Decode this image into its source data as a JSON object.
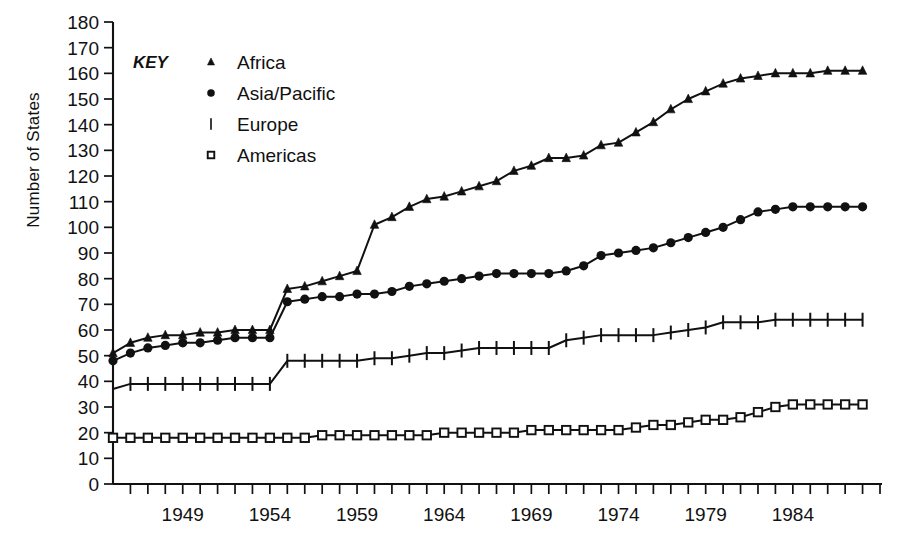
{
  "chart_data": {
    "type": "line",
    "title": "",
    "xlabel": "",
    "ylabel": "Number of States",
    "xlim": [
      1945,
      1989
    ],
    "ylim": [
      0,
      180
    ],
    "ytick_step": 10,
    "xtick_step": 1,
    "grid": false,
    "legend_title": "KEY",
    "legend_position": "top-left-inside",
    "x": [
      1945,
      1946,
      1947,
      1948,
      1949,
      1950,
      1951,
      1952,
      1953,
      1954,
      1955,
      1956,
      1957,
      1958,
      1959,
      1960,
      1961,
      1962,
      1963,
      1964,
      1965,
      1966,
      1967,
      1968,
      1969,
      1970,
      1971,
      1972,
      1973,
      1974,
      1975,
      1976,
      1977,
      1978,
      1979,
      1980,
      1981,
      1982,
      1983,
      1984,
      1985,
      1986,
      1987,
      1988
    ],
    "yticks": [
      0,
      10,
      20,
      30,
      40,
      50,
      60,
      70,
      80,
      90,
      100,
      110,
      120,
      130,
      140,
      150,
      160,
      170,
      180
    ],
    "xticks_labeled": [
      1949,
      1954,
      1959,
      1964,
      1969,
      1974,
      1979,
      1984
    ],
    "series": [
      {
        "name": "Africa",
        "marker": "triangle",
        "values": [
          51,
          55,
          57,
          58,
          58,
          59,
          59,
          60,
          60,
          60,
          76,
          77,
          79,
          81,
          83,
          101,
          104,
          108,
          111,
          112,
          114,
          116,
          118,
          122,
          124,
          127,
          127,
          128,
          132,
          133,
          137,
          141,
          146,
          150,
          153,
          156,
          158,
          159,
          160,
          160,
          160,
          161,
          161,
          161
        ]
      },
      {
        "name": "Asia/Pacific",
        "marker": "circle",
        "values": [
          48,
          51,
          53,
          54,
          55,
          55,
          56,
          57,
          57,
          57,
          71,
          72,
          73,
          73,
          74,
          74,
          75,
          77,
          78,
          79,
          80,
          81,
          82,
          82,
          82,
          82,
          83,
          85,
          89,
          90,
          91,
          92,
          94,
          96,
          98,
          100,
          103,
          106,
          107,
          108,
          108,
          108,
          108,
          108
        ]
      },
      {
        "name": "Europe",
        "marker": "bar",
        "values": [
          37,
          39,
          39,
          39,
          39,
          39,
          39,
          39,
          39,
          39,
          48,
          48,
          48,
          48,
          48,
          49,
          49,
          50,
          51,
          51,
          52,
          53,
          53,
          53,
          53,
          53,
          56,
          57,
          58,
          58,
          58,
          58,
          59,
          60,
          61,
          63,
          63,
          63,
          64,
          64,
          64,
          64,
          64,
          64
        ]
      },
      {
        "name": "Americas",
        "marker": "square",
        "values": [
          18,
          18,
          18,
          18,
          18,
          18,
          18,
          18,
          18,
          18,
          18,
          18,
          19,
          19,
          19,
          19,
          19,
          19,
          19,
          20,
          20,
          20,
          20,
          20,
          21,
          21,
          21,
          21,
          21,
          21,
          22,
          23,
          23,
          24,
          25,
          25,
          26,
          28,
          30,
          31,
          31,
          31,
          31,
          31
        ]
      }
    ]
  },
  "legend": {
    "key_label": "KEY",
    "entries": [
      {
        "label": "Africa",
        "marker": "triangle"
      },
      {
        "label": "Asia/Pacific",
        "marker": "circle"
      },
      {
        "label": "Europe",
        "marker": "bar"
      },
      {
        "label": "Americas",
        "marker": "square"
      }
    ]
  },
  "axes": {
    "y_title": "Number of States"
  },
  "colors": {
    "ink": "#111111",
    "background": "#ffffff"
  }
}
